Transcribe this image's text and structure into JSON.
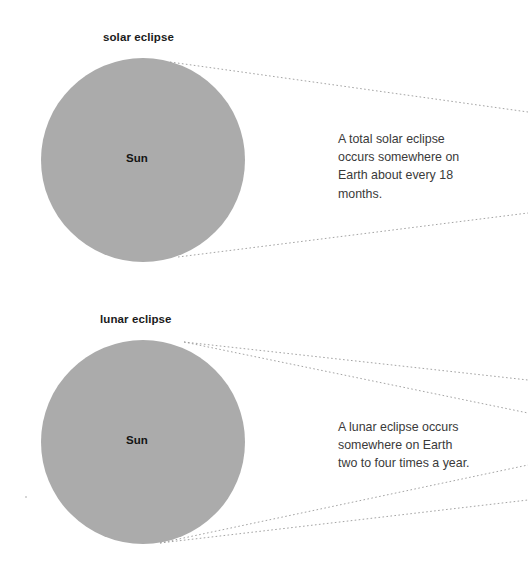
{
  "figure": {
    "background_color": "#ffffff",
    "sun_fill_color": "#ababab",
    "ray_color": "#9a9a9a",
    "title_color": "#1b1b1b",
    "caption_color": "#3a3a3a"
  },
  "sections": [
    {
      "id": "solar",
      "title": "solar eclipse",
      "sun_label": "Sun",
      "caption_lines": [
        "A total solar eclipse",
        "occurs somewhere on",
        "Earth about every 18",
        "months."
      ],
      "caption_text": "A total solar eclipse occurs somewhere on Earth about every 18 months.",
      "sun": {
        "cx": 143,
        "cy": 160,
        "r": 102
      },
      "rays": [
        {
          "x1": 170,
          "y1": 62,
          "x2": 528,
          "y2": 112
        },
        {
          "x1": 178,
          "y1": 257,
          "x2": 528,
          "y2": 213
        }
      ]
    },
    {
      "id": "lunar",
      "title": "lunar eclipse",
      "sun_label": "Sun",
      "caption_lines": [
        "A lunar eclipse occurs",
        "somewhere on Earth",
        "two to four times a year."
      ],
      "caption_text": "A lunar eclipse occurs somewhere on Earth two to four times a year.",
      "sun": {
        "cx": 143,
        "cy": 442,
        "r": 102
      },
      "rays": [
        {
          "x1": 184,
          "y1": 342,
          "x2": 528,
          "y2": 380
        },
        {
          "x1": 184,
          "y1": 342,
          "x2": 528,
          "y2": 413
        },
        {
          "x1": 160,
          "y1": 543,
          "x2": 528,
          "y2": 465
        },
        {
          "x1": 160,
          "y1": 543,
          "x2": 528,
          "y2": 500
        }
      ]
    }
  ]
}
